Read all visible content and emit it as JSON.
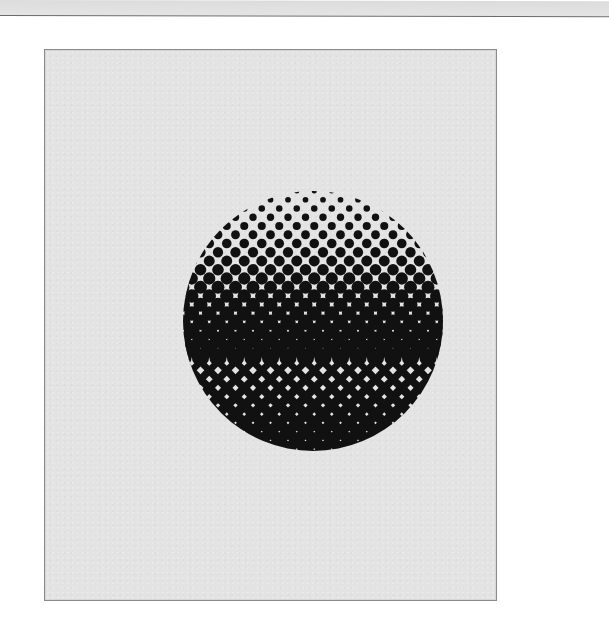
{
  "scene": {
    "description": "Halftone sphere: circle rendered with a 45-degree rotated dot grid, dots growing from small at the top to solid black at the bottom",
    "background_color": "#ffffff",
    "top_strip_color": "#dcdcdc",
    "panel": {
      "x": 44,
      "y": 49,
      "width": 451,
      "height": 550,
      "fill": "#e3e3e3",
      "border": "#8a8a8a"
    },
    "halftone": {
      "center_x": 313,
      "center_y": 321,
      "radius": 130,
      "dot_color": "#111111",
      "row_spacing_x": 17.5,
      "row_spacing_y": 8.75,
      "density_top": 0.05,
      "density_bottom": 1.0
    }
  }
}
